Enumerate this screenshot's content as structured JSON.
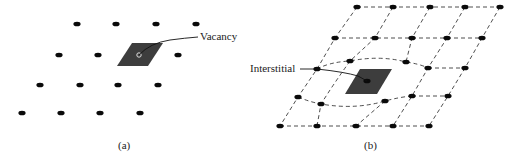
{
  "figure": {
    "panel_a": {
      "caption": "(a)",
      "label": "Vacancy",
      "atoms": [
        [
          77,
          24
        ],
        [
          116,
          24
        ],
        [
          156,
          24
        ],
        [
          196,
          24
        ],
        [
          59,
          55
        ],
        [
          98,
          55
        ],
        [
          178,
          55
        ],
        [
          40,
          85
        ],
        [
          80,
          85
        ],
        [
          118,
          85
        ],
        [
          158,
          85
        ],
        [
          22,
          113
        ],
        [
          61,
          113
        ],
        [
          100,
          113
        ],
        [
          140,
          113
        ]
      ],
      "vacancy_site": [
        139,
        55
      ],
      "defect_region": "117,66 132,43 163,43 148,66",
      "leader": "M139,55 Q150,43 170,40 Q185,38 198,37"
    },
    "panel_b": {
      "caption": "(b)",
      "label": "Interstitial",
      "atoms": [
        [
          357,
          7
        ],
        [
          393,
          7
        ],
        [
          430,
          7
        ],
        [
          465,
          7
        ],
        [
          500,
          7
        ],
        [
          335,
          38
        ],
        [
          375,
          38
        ],
        [
          412,
          38
        ],
        [
          447,
          38
        ],
        [
          482,
          38
        ],
        [
          350,
          61
        ],
        [
          406,
          62
        ],
        [
          428,
          68
        ],
        [
          465,
          68
        ],
        [
          317,
          69
        ],
        [
          298,
          97
        ],
        [
          321,
          104
        ],
        [
          385,
          101
        ],
        [
          412,
          96
        ],
        [
          448,
          96
        ],
        [
          280,
          126
        ],
        [
          317,
          126
        ],
        [
          356,
          126
        ],
        [
          393,
          126
        ],
        [
          429,
          126
        ]
      ],
      "interstitial_atom": [
        367,
        81
      ],
      "defect_region": "345,94 360,69 392,69 377,94",
      "dashed_lines": [
        "M357,7 L500,7",
        "M335,38 L482,38",
        "M428,68 L465,68",
        "M412,96 L448,96",
        "M280,126 L429,126",
        "M317,69 Q330,62 350,61 Q380,55 406,62 Q420,64 428,68",
        "M298,97 Q310,102 321,104 Q355,110 385,101 Q400,97 412,96",
        "M357,7 L335,38 L317,69 L298,97 L280,126",
        "M393,7 L375,38 L350,61 Q340,75 330,90 L321,104 L317,126",
        "M430,7 L412,38 L406,62",
        "M385,101 L356,126",
        "M465,7 L447,38 L428,68 L412,96 L393,126",
        "M500,7 L482,38 L465,68 L448,96 L429,126"
      ],
      "leader": "M300,69 L317,69 Q345,72 358,76 L367,81"
    }
  }
}
